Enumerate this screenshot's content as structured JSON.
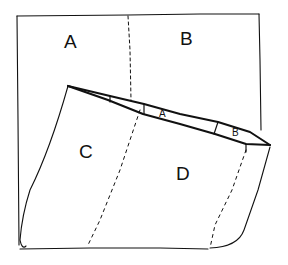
{
  "diagram": {
    "labels": {
      "top_left": "A",
      "top_right": "B",
      "lower_left": "C",
      "lower_right": "D",
      "roll_a": "A",
      "roll_b": "B"
    },
    "colors": {
      "line": "#111111",
      "background": "#ffffff"
    }
  }
}
